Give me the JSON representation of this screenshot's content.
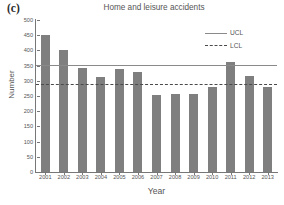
{
  "panel": {
    "label": "(c)"
  },
  "chart_data": {
    "type": "bar",
    "title": "Home and leisure accidents",
    "xlabel": "Year",
    "ylabel": "Number",
    "categories": [
      "2001",
      "2002",
      "2003",
      "2004",
      "2005",
      "2006",
      "2007",
      "2008",
      "2009",
      "2010",
      "2011",
      "2012",
      "2013"
    ],
    "values": [
      452,
      402,
      341,
      311,
      339,
      329,
      254,
      256,
      256,
      279,
      362,
      317,
      279
    ],
    "series": [
      {
        "name": "Number of accidents",
        "values": [
          452,
          402,
          341,
          311,
          339,
          329,
          254,
          256,
          256,
          279,
          362,
          317,
          279
        ]
      }
    ],
    "ylim": [
      0,
      500
    ],
    "ytick_values": [
      0,
      50,
      100,
      150,
      200,
      250,
      300,
      350,
      400,
      450,
      500
    ],
    "ytick_labels": [
      "0",
      "50",
      "100",
      "150",
      "200",
      "250",
      "300",
      "350",
      "400",
      "450",
      "500"
    ],
    "grid": false,
    "legend_position": "top-right",
    "bar_color": "#7f7f7f",
    "reference_lines": [
      {
        "name": "UCL",
        "label": "UCL",
        "value": 353,
        "style": "solid",
        "color": "#8a8a8a"
      },
      {
        "name": "LCL",
        "label": "LCL",
        "value": 291,
        "style": "dashed",
        "color": "#4a4a4a"
      }
    ],
    "legend": [
      {
        "label": "UCL",
        "style": "solid"
      },
      {
        "label": "LCL",
        "style": "dashed"
      }
    ]
  }
}
